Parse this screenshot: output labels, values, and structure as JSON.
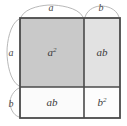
{
  "figure": {
    "colors": {
      "background": "#ffffff",
      "stroke": "#4a4a4a",
      "brace": "#b0b0b0",
      "label": "#3a3a3a",
      "fill_a_squared": "#c9c9c9",
      "fill_ab_right": "#e2e2e2",
      "fill_ab_bottom": "#fbfbfb",
      "fill_b_squared": "#fdfdfd"
    },
    "geometry": {
      "square_left": 20,
      "square_top": 18,
      "square_right": 120,
      "square_bottom": 118,
      "divider_x": 84,
      "divider_y": 87
    },
    "cells": [
      {
        "id": "cell-a-squared",
        "base": "a",
        "exponent": "2",
        "fill": "#c9c9c9",
        "x": 20,
        "y": 18,
        "w": 64,
        "h": 69,
        "label_x": 52,
        "label_y": 56
      },
      {
        "id": "cell-ab-right",
        "base": "ab",
        "exponent": "",
        "fill": "#e2e2e2",
        "x": 84,
        "y": 18,
        "w": 36,
        "h": 69,
        "label_x": 102,
        "label_y": 56
      },
      {
        "id": "cell-ab-bottom",
        "base": "ab",
        "exponent": "",
        "fill": "#fbfbfb",
        "x": 20,
        "y": 87,
        "w": 64,
        "h": 31,
        "label_x": 52,
        "label_y": 106
      },
      {
        "id": "cell-b-squared",
        "base": "b",
        "exponent": "2",
        "fill": "#fdfdfd",
        "x": 84,
        "y": 87,
        "w": 36,
        "h": 31,
        "label_x": 102,
        "label_y": 106
      }
    ],
    "dimensions": [
      {
        "id": "dim-top-a",
        "label": "a",
        "side": "top",
        "label_x": 51,
        "label_y": 11,
        "brace": "M 21 17 C 26 7, 44 5, 51 5 C 58 5, 78 7, 83 17"
      },
      {
        "id": "dim-top-b",
        "label": "b",
        "side": "top",
        "label_x": 101,
        "label_y": 11,
        "brace": "M 85 17 C 88 8, 97 6, 101 6 C 106 6, 116 8, 119 17"
      },
      {
        "id": "dim-left-a",
        "label": "a",
        "side": "left",
        "label_x": 11,
        "label_y": 56,
        "brace": "M 19 19 C 10 24, 7 42, 7 52 C 7 63, 10 81, 19 86"
      },
      {
        "id": "dim-left-b",
        "label": "b",
        "side": "left",
        "label_x": 11,
        "label_y": 107,
        "brace": "M 19 88 C 13 91, 10 98, 10 102 C 10 108, 13 115, 19 117"
      }
    ]
  }
}
